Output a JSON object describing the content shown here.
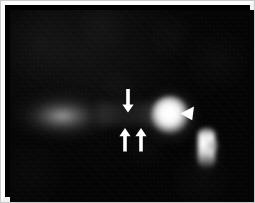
{
  "figure": {
    "domain": "microscopy-image",
    "frame": {
      "border_color": "#fdfdfd",
      "outline_color": "#c9c9c9",
      "background_color": "#040404"
    },
    "canvas": {
      "width": 255,
      "height": 203,
      "field_left": 5,
      "field_top": 5,
      "field_width": 245,
      "field_height": 192
    },
    "colors": {
      "background": "#040404",
      "signal_bright": "#ffffff",
      "signal_mid": "#b2b2b2",
      "signal_faint": "#606060",
      "marker": "#ffffff"
    },
    "features": [
      {
        "id": "left-band",
        "name": "diffuse-left-band",
        "description": "broad diffuse elongated glow",
        "x": 50,
        "y": 106,
        "width": 120,
        "height": 56,
        "intensity": "faint",
        "shape": "ellipse"
      },
      {
        "id": "mid-streak",
        "name": "connecting-streak",
        "description": "faint horizontal streak linking band to bright spot",
        "x": 128,
        "y": 104,
        "width": 80,
        "height": 22,
        "intensity": "faint",
        "shape": "streak"
      },
      {
        "id": "bright-spot",
        "name": "primary-bright-spot",
        "description": "saturated round high-intensity spot",
        "x": 160,
        "y": 105,
        "width": 38,
        "height": 38,
        "intensity": "saturated",
        "shape": "circle"
      },
      {
        "id": "vertical-streak",
        "name": "vertical-bright-structure",
        "description": "elongated vertical bright structure at lower right",
        "x": 196,
        "y": 138,
        "width": 17,
        "height": 40,
        "intensity": "bright",
        "shape": "vertical-bar"
      }
    ],
    "markers": [
      {
        "id": "arrow-down-1",
        "name": "down-arrow-marker",
        "type": "arrow",
        "direction": "down",
        "x": 118,
        "y": 92,
        "length": 18,
        "color": "#ffffff",
        "label": ""
      },
      {
        "id": "arrow-up-1",
        "name": "up-arrow-marker-left",
        "type": "arrow",
        "direction": "up",
        "x": 115,
        "y": 131,
        "length": 18,
        "color": "#ffffff",
        "label": ""
      },
      {
        "id": "arrow-up-2",
        "name": "up-arrow-marker-right",
        "type": "arrow",
        "direction": "up",
        "x": 131,
        "y": 131,
        "length": 18,
        "color": "#ffffff",
        "label": ""
      },
      {
        "id": "arrowhead-1",
        "name": "arrowhead-marker",
        "type": "arrowhead",
        "direction": "left",
        "x": 178,
        "y": 104,
        "size": 12,
        "color": "#ffffff",
        "label": ""
      }
    ],
    "marker_count": 4,
    "caption": ""
  }
}
